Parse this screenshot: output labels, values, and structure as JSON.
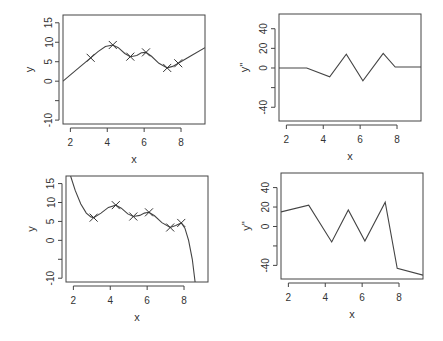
{
  "chart_data": [
    {
      "id": "panel-top-left",
      "type": "line",
      "title": "",
      "xlabel": "x",
      "ylabel": "y",
      "xlim": [
        1.6,
        9.3
      ],
      "ylim": [
        -11,
        17
      ],
      "xticks": [
        2,
        4,
        6,
        8
      ],
      "yticks": [
        -10,
        -5,
        0,
        5,
        10,
        15
      ],
      "ytick_labels": [
        "-10",
        "",
        "0",
        "5",
        "10",
        "15"
      ],
      "grid": false,
      "legend": null,
      "points": {
        "x": [
          3.1,
          4.3,
          5.25,
          6.1,
          7.25,
          7.85
        ],
        "y": [
          6.0,
          9.3,
          6.3,
          7.4,
          3.4,
          4.6
        ],
        "marker": "x"
      },
      "curve": {
        "name": "natural spline fit",
        "x": [
          1.6,
          2.0,
          2.5,
          3.1,
          3.5,
          3.9,
          4.3,
          4.6,
          4.95,
          5.25,
          5.6,
          5.85,
          6.1,
          6.4,
          6.8,
          7.25,
          7.55,
          7.85,
          8.5,
          9.3
        ],
        "y": [
          0.0,
          1.6,
          3.6,
          6.0,
          7.6,
          8.9,
          9.3,
          8.6,
          7.1,
          6.3,
          6.6,
          7.3,
          7.4,
          6.4,
          4.6,
          3.4,
          3.8,
          4.6,
          6.4,
          8.6
        ]
      }
    },
    {
      "id": "panel-top-right",
      "type": "line",
      "title": "",
      "xlabel": "x",
      "ylabel": "y''",
      "xlim": [
        1.6,
        9.3
      ],
      "ylim": [
        -54,
        55
      ],
      "xticks": [
        2,
        4,
        6,
        8
      ],
      "yticks": [
        -40,
        -20,
        0,
        20,
        40
      ],
      "ytick_labels": [
        "-40",
        "",
        "0",
        "20",
        "40"
      ],
      "grid": false,
      "legend": null,
      "curve": {
        "name": "second derivative",
        "x": [
          1.6,
          3.1,
          4.35,
          5.25,
          6.15,
          7.25,
          7.9,
          9.3
        ],
        "y": [
          0,
          0,
          -9,
          14,
          -13,
          15,
          1,
          1
        ]
      }
    },
    {
      "id": "panel-bottom-left",
      "type": "line",
      "title": "",
      "xlabel": "x",
      "ylabel": "y",
      "xlim": [
        1.6,
        9.3
      ],
      "ylim": [
        -11,
        17
      ],
      "xticks": [
        2,
        4,
        6,
        8
      ],
      "yticks": [
        -10,
        -5,
        0,
        5,
        10,
        15
      ],
      "ytick_labels": [
        "-10",
        "",
        "0",
        "5",
        "10",
        "15"
      ],
      "grid": false,
      "legend": null,
      "points": {
        "x": [
          3.1,
          4.3,
          5.25,
          6.1,
          7.25,
          7.85
        ],
        "y": [
          6.0,
          9.3,
          6.3,
          7.4,
          3.4,
          4.6
        ],
        "marker": "x"
      },
      "curve": {
        "name": "spline fit (unconstrained ends)",
        "x": [
          1.85,
          2.1,
          2.4,
          2.7,
          2.95,
          3.1,
          3.5,
          3.9,
          4.3,
          4.6,
          4.95,
          5.25,
          5.6,
          5.85,
          6.1,
          6.4,
          6.8,
          7.25,
          7.55,
          7.85,
          8.05,
          8.25,
          8.45,
          8.6
        ],
        "y": [
          17,
          13.2,
          9.6,
          7.2,
          6.2,
          6.0,
          7.2,
          8.7,
          9.3,
          8.5,
          7.0,
          6.3,
          6.6,
          7.2,
          7.4,
          6.5,
          4.7,
          3.4,
          3.9,
          4.6,
          3.2,
          0.0,
          -5.0,
          -11.0
        ]
      }
    },
    {
      "id": "panel-bottom-right",
      "type": "line",
      "title": "",
      "xlabel": "x",
      "ylabel": "y''",
      "xlim": [
        1.6,
        9.3
      ],
      "ylim": [
        -54,
        55
      ],
      "xticks": [
        2,
        4,
        6,
        8
      ],
      "yticks": [
        -40,
        -20,
        0,
        20,
        40
      ],
      "ytick_labels": [
        "-40",
        "",
        "0",
        "20",
        "40"
      ],
      "grid": false,
      "legend": null,
      "curve": {
        "name": "second derivative",
        "x": [
          1.6,
          3.1,
          4.35,
          5.25,
          6.15,
          7.25,
          7.9,
          9.3
        ],
        "y": [
          15,
          22,
          -16,
          17,
          -15,
          25,
          -43,
          -50
        ]
      }
    }
  ],
  "layout": {
    "panels": [
      {
        "box": [
          63,
          15,
          205,
          124
        ],
        "xlabel_y": 163,
        "ylabel_x": 29,
        "ticklabel_x": 49
      },
      {
        "box": [
          279,
          14,
          421,
          121
        ],
        "xlabel_y": 160,
        "ylabel_x": 244,
        "ticklabel_x": 264
      },
      {
        "box": [
          66,
          176,
          208,
          282
        ],
        "xlabel_y": 321,
        "ylabel_x": 31,
        "ticklabel_x": 51
      },
      {
        "box": [
          281,
          173,
          423,
          279
        ],
        "xlabel_y": 318,
        "ylabel_x": 246,
        "ticklabel_x": 266
      }
    ],
    "ink_color": "#444444",
    "background": "#ffffff"
  }
}
